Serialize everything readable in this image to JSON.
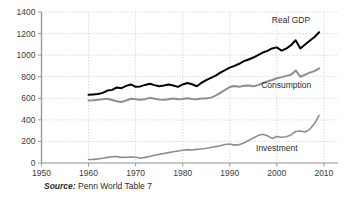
{
  "chart_data": {
    "type": "line",
    "title": "",
    "xlabel": "",
    "ylabel": "",
    "xlim": [
      1950,
      2013
    ],
    "ylim": [
      0,
      1400
    ],
    "grid": true,
    "legend_position": "inline-labels",
    "xticks": [
      "1950",
      "1960",
      "1970",
      "1980",
      "1990",
      "2000",
      "2010"
    ],
    "xtick_values": [
      1950,
      1960,
      1970,
      1980,
      1990,
      2000,
      2010
    ],
    "yticks": [
      "0",
      "200",
      "400",
      "600",
      "800",
      "1000",
      "1200",
      "1400"
    ],
    "ytick_values": [
      0,
      200,
      400,
      600,
      800,
      1000,
      1200,
      1400
    ],
    "x": [
      1960,
      1961,
      1962,
      1963,
      1964,
      1965,
      1966,
      1967,
      1968,
      1969,
      1970,
      1971,
      1972,
      1973,
      1974,
      1975,
      1976,
      1977,
      1978,
      1979,
      1980,
      1981,
      1982,
      1983,
      1984,
      1985,
      1986,
      1987,
      1988,
      1989,
      1990,
      1991,
      1992,
      1993,
      1994,
      1995,
      1996,
      1997,
      1998,
      1999,
      2000,
      2001,
      2002,
      2003,
      2004,
      2005,
      2006,
      2007,
      2008,
      2009
    ],
    "series": [
      {
        "name": "Real GDP",
        "color": "#000000",
        "width": 2.0,
        "label_x": 2003,
        "label_y": 1300,
        "values": [
          632,
          636,
          640,
          650,
          672,
          678,
          700,
          694,
          715,
          728,
          706,
          710,
          724,
          734,
          722,
          712,
          718,
          728,
          718,
          706,
          728,
          742,
          730,
          712,
          744,
          768,
          790,
          810,
          838,
          862,
          884,
          900,
          920,
          944,
          960,
          978,
          1000,
          1024,
          1040,
          1062,
          1072,
          1042,
          1060,
          1092,
          1138,
          1062,
          1098,
          1134,
          1168,
          1212
        ]
      },
      {
        "name": "Consumption",
        "color": "#8e8e8e",
        "width": 2.0,
        "label_x": 2002,
        "label_y": 700,
        "values": [
          580,
          582,
          586,
          590,
          596,
          584,
          572,
          566,
          580,
          596,
          592,
          586,
          592,
          604,
          596,
          588,
          586,
          592,
          598,
          592,
          594,
          600,
          594,
          592,
          598,
          598,
          606,
          624,
          650,
          678,
          704,
          714,
          706,
          716,
          718,
          712,
          722,
          740,
          756,
          770,
          786,
          796,
          808,
          818,
          858,
          800,
          818,
          838,
          852,
          878
        ]
      },
      {
        "name": "Investment",
        "color": "#8e8e8e",
        "width": 1.6,
        "label_x": 2000,
        "label_y": 110,
        "values": [
          32,
          34,
          38,
          44,
          52,
          58,
          60,
          52,
          54,
          56,
          54,
          44,
          52,
          60,
          72,
          80,
          88,
          96,
          104,
          112,
          118,
          124,
          120,
          126,
          130,
          136,
          144,
          152,
          160,
          172,
          176,
          166,
          170,
          186,
          208,
          232,
          254,
          266,
          252,
          228,
          246,
          238,
          244,
          260,
          292,
          296,
          288,
          312,
          366,
          442
        ]
      }
    ],
    "source": {
      "label": "Source:",
      "text": "Penn World Table 7"
    }
  },
  "axis": {
    "y_axis_name": "value-axis",
    "x_axis_name": "year-axis"
  }
}
